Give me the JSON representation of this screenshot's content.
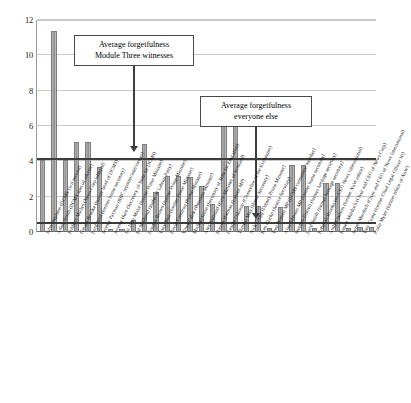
{
  "chart_data": {
    "type": "bar",
    "title": "",
    "subtitle": "",
    "xlabel": "",
    "ylabel": "",
    "ylim": [
      0,
      12
    ],
    "yticks": [
      0,
      2,
      4,
      6,
      8,
      10,
      12
    ],
    "ytick_labels": [
      "0",
      "2",
      "4",
      "6",
      "8",
      "10",
      "12"
    ],
    "grid": true,
    "legend": "none",
    "series_name": "Number of times witness could not recall",
    "categories": [
      "John Stephens (DCMS civil servant)",
      "Adam Smith (DCMS special adviser)",
      "Frédéric Michel (News Corp lobbyist)",
      "Gerard Brooke (former head of DCMS)",
      "Lord Reid (former home secretary)",
      "Jeremy Paxman (BBC reporter/interviewer)",
      "Jeremy Hunt (Secretary of State for DCMS)",
      "Sir John Major (former Prime Minister)",
      "Ed Miliband (leader of Labour Party)",
      "Gordon Brown (former Prime Minister)",
      "Tony Blair (former Prime Minister)",
      "David Cameron (Prime Minister)",
      "Vince Cable (Business Minister)",
      "Michael Gove (Secretary of State for Education)",
      "Alex Salmond (First Minister of Scotland)",
      "Harriet Harman (Labour MP)",
      "George Osborne (Chancellor of the Exchequer)",
      "Theresa May (Home Secretary)",
      "Nick Clegg (Deputy Prime Minister)",
      "Ken Clarke (Justice Secretary)",
      "Tom Watson MP (DCMS committee member)",
      "Alan Johnson MP (former home secretary)",
      "Stephen Dorrell (former heritage secretary)",
      "Lord Smith (former heritage secretary)",
      "Rebekah Brooks (ex-CEO News International)",
      "Andy Coulson (former NoW editor)",
      "Rupert Murdoch (Chair and CEO of News Corp)",
      "James Murdoch (Chair and CEO of News International)",
      "Tom Crone (former Chief Legal Officer NI)",
      "Colin Myler (former editor of NoW)"
    ],
    "values": [
      4.1,
      11.35,
      4.1,
      5.1,
      5.1,
      3.7,
      0.15,
      0.15,
      0.7,
      5.0,
      2.25,
      3.15,
      3.15,
      3.1,
      2.6,
      1.6,
      7.15,
      7.15,
      1.5,
      1.5,
      0.25,
      1.4,
      3.8,
      3.8,
      0.2,
      2.8,
      2.8,
      0.25,
      0.3,
      0.3
    ],
    "reference_lines": [
      {
        "label": "Average forgetfulness Module Three witnesses",
        "value": 4.05
      },
      {
        "label": "Average forgetfulness everyone else",
        "value": 0.45
      }
    ]
  },
  "annotations": {
    "module_three": {
      "line1": "Average forgetfulness",
      "line2": "Module Three witnesses"
    },
    "everyone_else": {
      "line1": "Average forgetfulness",
      "line2": "everyone else"
    }
  },
  "colors": {
    "bar_fill": "#9d9d9d",
    "bar_edge": "#7d7d7d",
    "gridline": "#c9c9c9",
    "reference_line": "#3d3d3d",
    "axis": "#6d6d6d",
    "text": "#111111",
    "background": "#ffffff"
  }
}
